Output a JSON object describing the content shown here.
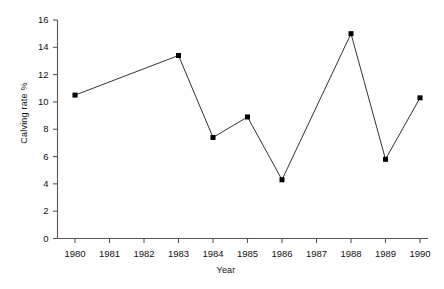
{
  "chart_data": {
    "type": "line",
    "title": "",
    "xlabel": "Year",
    "ylabel": "Calving rate %",
    "x": [
      1980,
      1983,
      1984,
      1985,
      1986,
      1988,
      1989,
      1990
    ],
    "values": [
      10.5,
      13.4,
      7.4,
      8.9,
      4.3,
      15.0,
      5.8,
      10.3
    ],
    "series": [
      {
        "name": "Calving rate",
        "points": [
          {
            "year": 1980,
            "value": 10.5
          },
          {
            "year": 1983,
            "value": 13.4
          },
          {
            "year": 1984,
            "value": 7.4
          },
          {
            "year": 1985,
            "value": 8.9
          },
          {
            "year": 1986,
            "value": 4.3
          },
          {
            "year": 1988,
            "value": 15.0
          },
          {
            "year": 1989,
            "value": 5.8
          },
          {
            "year": 1990,
            "value": 10.3
          }
        ]
      }
    ],
    "xlim": [
      1979.5,
      1990.5
    ],
    "ylim": [
      0,
      16
    ],
    "xticks": [
      1980,
      1981,
      1982,
      1983,
      1984,
      1985,
      1986,
      1987,
      1988,
      1989,
      1990
    ],
    "xtick_labels": [
      "1980",
      "1981",
      "1982",
      "1983",
      "1984",
      "1985",
      "1986",
      "1987",
      "1988",
      "1989",
      "1990"
    ],
    "yticks": [
      0,
      2,
      4,
      6,
      8,
      10,
      12,
      14,
      16
    ],
    "ytick_labels": [
      "0",
      "2",
      "4",
      "6",
      "8",
      "10",
      "12",
      "14",
      "16"
    ],
    "grid": false,
    "legend": "none",
    "marker": "square",
    "line_color": "#333333",
    "marker_color": "#000000",
    "axis_color": "#555555"
  }
}
